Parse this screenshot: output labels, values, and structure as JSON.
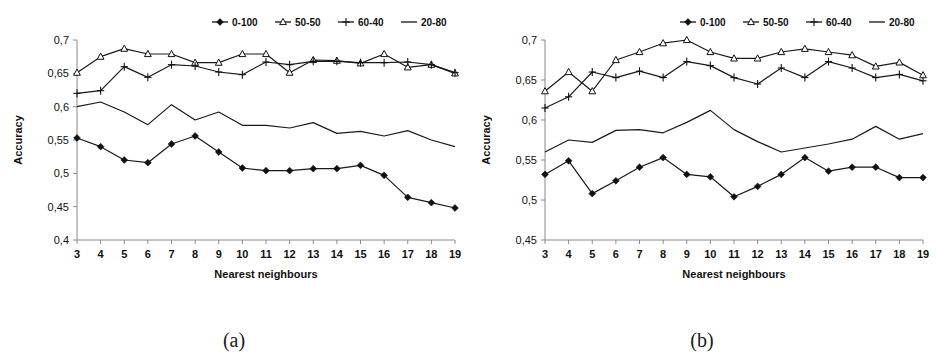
{
  "figure": {
    "panels": [
      {
        "caption": "(a)",
        "axis": {
          "ylabel": "Accuracy",
          "xlabel": "Nearest neighbours",
          "yticks": [
            "0,7",
            "0,65",
            "0,6",
            "0,55",
            "0,5",
            "0,45",
            "0,4"
          ],
          "xticks": [
            "3",
            "4",
            "5",
            "6",
            "7",
            "8",
            "9",
            "10",
            "11",
            "12",
            "13",
            "14",
            "15",
            "16",
            "17",
            "18",
            "19"
          ]
        },
        "legend": [
          {
            "label": "0-100",
            "marker": "diamond"
          },
          {
            "label": "50-50",
            "marker": "triangle"
          },
          {
            "label": "60-40",
            "marker": "plus"
          },
          {
            "label": "20-80",
            "marker": "line"
          }
        ]
      },
      {
        "caption": "(b)",
        "axis": {
          "ylabel": "Accuracy",
          "xlabel": "Nearest neighbours",
          "yticks": [
            "0,7",
            "0,65",
            "0,6",
            "0,55",
            "0,5",
            "0,45"
          ],
          "xticks": [
            "3",
            "4",
            "5",
            "6",
            "7",
            "8",
            "9",
            "10",
            "11",
            "12",
            "13",
            "14",
            "15",
            "16",
            "17",
            "18",
            "19"
          ]
        },
        "legend": [
          {
            "label": "0-100",
            "marker": "diamond"
          },
          {
            "label": "50-50",
            "marker": "triangle"
          },
          {
            "label": "60-40",
            "marker": "plus"
          },
          {
            "label": "20-80",
            "marker": "line"
          }
        ]
      }
    ]
  },
  "chart_data": [
    {
      "type": "line",
      "title": "",
      "subtitle": "(a)",
      "xlabel": "Nearest neighbours",
      "ylabel": "Accuracy",
      "x": [
        3,
        4,
        5,
        6,
        7,
        8,
        9,
        10,
        11,
        12,
        13,
        14,
        15,
        16,
        17,
        18,
        19
      ],
      "xlim": [
        3,
        19
      ],
      "ylim": [
        0.4,
        0.7
      ],
      "ytick_values": [
        0.7,
        0.65,
        0.6,
        0.55,
        0.5,
        0.45,
        0.4
      ],
      "ytick_labels": [
        "0,7",
        "0,65",
        "0,6",
        "0,55",
        "0,5",
        "0,45",
        "0,4"
      ],
      "grid": false,
      "legend_position": "top-right",
      "series": [
        {
          "name": "0-100",
          "marker": "diamond",
          "values": [
            0.553,
            0.54,
            0.52,
            0.516,
            0.544,
            0.556,
            0.532,
            0.508,
            0.504,
            0.504,
            0.507,
            0.507,
            0.512,
            0.497,
            0.464,
            0.456,
            0.448
          ]
        },
        {
          "name": "50-50",
          "marker": "triangle",
          "values": [
            0.651,
            0.675,
            0.687,
            0.679,
            0.679,
            0.666,
            0.666,
            0.679,
            0.679,
            0.651,
            0.67,
            0.669,
            0.665,
            0.679,
            0.659,
            0.663,
            0.65
          ]
        },
        {
          "name": "60-40",
          "marker": "plus",
          "values": [
            0.62,
            0.624,
            0.66,
            0.644,
            0.663,
            0.661,
            0.652,
            0.648,
            0.667,
            0.663,
            0.668,
            0.668,
            0.666,
            0.666,
            0.667,
            0.663,
            0.651
          ]
        },
        {
          "name": "20-80",
          "marker": "line",
          "values": [
            0.6,
            0.607,
            0.592,
            0.573,
            0.603,
            0.58,
            0.592,
            0.572,
            0.572,
            0.568,
            0.576,
            0.56,
            0.563,
            0.556,
            0.564,
            0.55,
            0.54
          ]
        }
      ]
    },
    {
      "type": "line",
      "title": "",
      "subtitle": "(b)",
      "xlabel": "Nearest neighbours",
      "ylabel": "Accuracy",
      "x": [
        3,
        4,
        5,
        6,
        7,
        8,
        9,
        10,
        11,
        12,
        13,
        14,
        15,
        16,
        17,
        18,
        19
      ],
      "xlim": [
        3,
        19
      ],
      "ylim": [
        0.45,
        0.7
      ],
      "ytick_values": [
        0.7,
        0.65,
        0.6,
        0.55,
        0.5,
        0.45
      ],
      "ytick_labels": [
        "0,7",
        "0,65",
        "0,6",
        "0,55",
        "0,5",
        "0,45"
      ],
      "grid": false,
      "legend_position": "top-right",
      "series": [
        {
          "name": "0-100",
          "marker": "diamond",
          "values": [
            0.532,
            0.549,
            0.508,
            0.524,
            0.541,
            0.553,
            0.532,
            0.529,
            0.504,
            0.517,
            0.532,
            0.553,
            0.536,
            0.541,
            0.541,
            0.528,
            0.528
          ]
        },
        {
          "name": "50-50",
          "marker": "triangle",
          "values": [
            0.636,
            0.66,
            0.636,
            0.675,
            0.685,
            0.696,
            0.7,
            0.685,
            0.677,
            0.677,
            0.685,
            0.689,
            0.685,
            0.681,
            0.667,
            0.672,
            0.656
          ]
        },
        {
          "name": "60-40",
          "marker": "plus",
          "values": [
            0.615,
            0.629,
            0.66,
            0.653,
            0.661,
            0.653,
            0.673,
            0.668,
            0.653,
            0.645,
            0.665,
            0.653,
            0.673,
            0.665,
            0.653,
            0.657,
            0.649
          ]
        },
        {
          "name": "20-80",
          "marker": "line",
          "values": [
            0.56,
            0.575,
            0.572,
            0.587,
            0.588,
            0.584,
            0.597,
            0.612,
            0.588,
            0.573,
            0.56,
            0.565,
            0.57,
            0.576,
            0.592,
            0.576,
            0.583
          ]
        }
      ]
    }
  ]
}
